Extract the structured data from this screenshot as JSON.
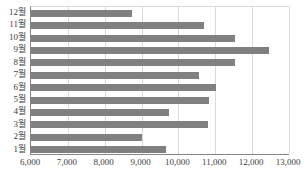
{
  "chart_data": {
    "type": "bar",
    "orientation": "horizontal",
    "title": "",
    "subtitle": "",
    "xlabel": "",
    "ylabel": "",
    "categories": [
      "1월",
      "2월",
      "3월",
      "4월",
      "5월",
      "6월",
      "7월",
      "8월",
      "9월",
      "10월",
      "11월",
      "12월"
    ],
    "values": [
      9660,
      9010,
      10790,
      9740,
      10820,
      11010,
      10550,
      11530,
      12450,
      11530,
      10690,
      8740
    ],
    "series": [
      {
        "name": "",
        "values": [
          9660,
          9010,
          10790,
          9740,
          10820,
          11010,
          10550,
          11530,
          12450,
          11530,
          10690,
          8740
        ]
      }
    ],
    "display_order_top_to_bottom": [
      "12월",
      "11월",
      "10월",
      "9월",
      "8월",
      "7월",
      "6월",
      "5월",
      "4월",
      "3월",
      "2월",
      "1월"
    ],
    "xlim": [
      6000,
      13000
    ],
    "xticks": [
      6000,
      7000,
      8000,
      9000,
      10000,
      11000,
      12000,
      13000
    ],
    "xtick_labels": [
      "6,000",
      "7,000",
      "8,000",
      "9,000",
      "10,000",
      "11,000",
      "12,000",
      "13,000"
    ],
    "grid": {
      "vertical": true,
      "horizontal": false
    },
    "legend": {
      "visible": false,
      "position": "none",
      "entries": []
    },
    "colors": {
      "bar": "#808080",
      "gridline": "#d9d9d9",
      "axis": "#868686",
      "tick_label": "#404040",
      "background": "#ffffff"
    },
    "annotations": []
  }
}
